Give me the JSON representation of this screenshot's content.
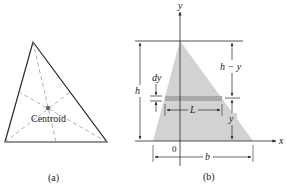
{
  "panel_a": {
    "caption": "(a)",
    "centroid_label": "Centroid",
    "triangle": {
      "apex": [
        33,
        42
      ],
      "left": [
        5,
        142
      ],
      "right": [
        107,
        142
      ]
    },
    "centroid": [
      48,
      108
    ],
    "colors": {
      "stroke": "#2a2a2a",
      "median": "#9a9a9a",
      "dot": "#666666"
    }
  },
  "panel_b": {
    "caption": "(b)",
    "axis_x_label": "x",
    "axis_y_label": "y",
    "origin_label": "0",
    "labels": {
      "h": "h",
      "dy": "dy",
      "h_minus_y": "h − y",
      "L": "L",
      "y": "y",
      "b": "b"
    },
    "colors": {
      "fill": "#d2d2d2",
      "strip": "#a9a9a9",
      "stroke": "#2a2a2a"
    }
  }
}
